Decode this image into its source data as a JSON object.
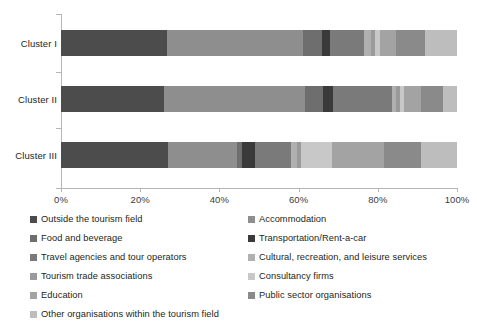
{
  "chart_data": {
    "type": "bar",
    "orientation": "horizontal",
    "stacked": true,
    "normalized": true,
    "title": "",
    "xlabel": "",
    "ylabel": "",
    "xlim": [
      0,
      100
    ],
    "xticks": [
      "0%",
      "20%",
      "40%",
      "60%",
      "80%",
      "100%"
    ],
    "xtick_values": [
      0,
      20,
      40,
      60,
      80,
      100
    ],
    "grid": false,
    "legend_position": "bottom",
    "categories": [
      "Cluster I",
      "Cluster II",
      "Cluster III"
    ],
    "series": [
      {
        "name": "Outside the tourism field",
        "color": "#4c4c4c",
        "values": [
          26.8,
          26.0,
          27.0
        ]
      },
      {
        "name": "Accommodation",
        "color": "#8e8e8e",
        "values": [
          34.2,
          35.5,
          17.5
        ]
      },
      {
        "name": "Food and beverage",
        "color": "#6e6e6e",
        "values": [
          5.0,
          4.7,
          1.3
        ]
      },
      {
        "name": "Transportation/Rent-a-car",
        "color": "#3a3a3a",
        "values": [
          2.0,
          2.5,
          3.2
        ]
      },
      {
        "name": "Travel agencies and tour operators",
        "color": "#7a7a7a",
        "values": [
          8.5,
          14.8,
          9.0
        ]
      },
      {
        "name": "Cultural, recreation, and leisure services",
        "color": "#b0b0b0",
        "values": [
          1.8,
          1.2,
          1.5
        ]
      },
      {
        "name": "Tourism trade associations",
        "color": "#9a9a9a",
        "values": [
          1.0,
          1.0,
          1.0
        ]
      },
      {
        "name": "Consultancy firms",
        "color": "#c8c8c8",
        "values": [
          1.2,
          0.8,
          8.0
        ]
      },
      {
        "name": "Education",
        "color": "#a3a3a3",
        "values": [
          4.0,
          4.5,
          13.0
        ]
      },
      {
        "name": "Public sector organisations",
        "color": "#8a8a8a",
        "values": [
          7.5,
          5.5,
          9.5
        ]
      },
      {
        "name": "Other organisations within the tourism field",
        "color": "#bdbdbd",
        "values": [
          8.0,
          3.5,
          9.0
        ]
      }
    ]
  },
  "axis": {
    "xticks": [
      {
        "label": "0%",
        "value": 0
      },
      {
        "label": "20%",
        "value": 20
      },
      {
        "label": "40%",
        "value": 40
      },
      {
        "label": "60%",
        "value": 60
      },
      {
        "label": "80%",
        "value": 80
      },
      {
        "label": "100%",
        "value": 100
      }
    ],
    "categories": [
      "Cluster I",
      "Cluster II",
      "Cluster III"
    ]
  },
  "legend": {
    "left_column": [
      {
        "label": "Outside the tourism field",
        "color": "#4c4c4c"
      },
      {
        "label": "Food and beverage",
        "color": "#6e6e6e"
      },
      {
        "label": "Travel agencies and tour operators",
        "color": "#7a7a7a"
      },
      {
        "label": "Tourism trade associations",
        "color": "#9a9a9a"
      },
      {
        "label": "Education",
        "color": "#a3a3a3"
      },
      {
        "label": "Other organisations within the tourism field",
        "color": "#bdbdbd"
      }
    ],
    "right_column": [
      {
        "label": "Accommodation",
        "color": "#8e8e8e"
      },
      {
        "label": "Transportation/Rent-a-car",
        "color": "#3a3a3a"
      },
      {
        "label": "Cultural, recreation, and leisure services",
        "color": "#b0b0b0"
      },
      {
        "label": "Consultancy firms",
        "color": "#c8c8c8"
      },
      {
        "label": "Public sector organisations",
        "color": "#8a8a8a"
      }
    ]
  }
}
